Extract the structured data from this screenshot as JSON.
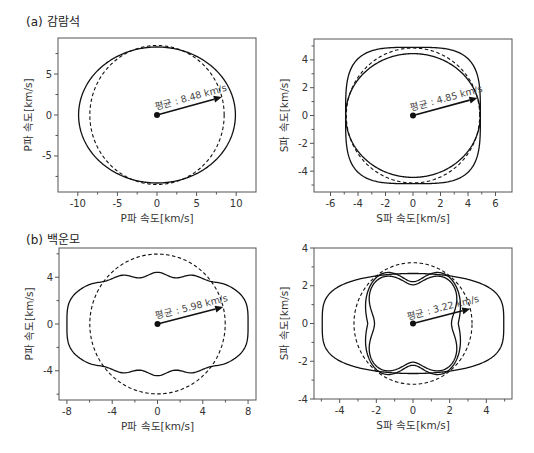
{
  "sections": [
    {
      "label": "(a) 감람석"
    },
    {
      "label": "(b) 백운모"
    }
  ],
  "chart_data": [
    {
      "type": "line",
      "section": "(a) 감람석",
      "xlabel": "P파 속도[km/s]",
      "ylabel": "P파 속도[km/s]",
      "xlim": [
        -12.5,
        12.5
      ],
      "ylim": [
        -9.4,
        9.4
      ],
      "xticks": [
        -10,
        -5,
        0,
        5,
        10
      ],
      "yticks": [
        -5,
        0,
        5
      ],
      "minor_xticks": [
        -7.5,
        -2.5,
        2.5,
        7.5
      ],
      "minor_yticks": [
        -7.5,
        -2.5,
        2.5,
        7.5
      ],
      "annotation": "평균 : 8.48 km/s",
      "mean": 8.48,
      "arrow_angle_deg": 15,
      "series": [
        {
          "name": "velocity surface",
          "style": "solid",
          "shape": "ellipse",
          "a": 9.9,
          "b": 8.3,
          "p": 2
        },
        {
          "name": "mean (isotropic)",
          "style": "dashed",
          "shape": "circle",
          "r": 8.48
        }
      ]
    },
    {
      "type": "line",
      "section": "(a) 감람석",
      "xlabel": "S파 속도[km/s]",
      "ylabel": "S파 속도[km/s]",
      "xlim": [
        -7.2,
        7.2
      ],
      "ylim": [
        -5.5,
        5.5
      ],
      "xticks": [
        -6,
        -4,
        -2,
        0,
        2,
        4,
        6
      ],
      "yticks": [
        -4,
        -2,
        0,
        2,
        4
      ],
      "minor_xticks": [
        -5,
        -3,
        -1,
        1,
        3,
        5
      ],
      "minor_yticks": [
        -5,
        -3,
        -1,
        1,
        3,
        5
      ],
      "annotation": "평균 : 4.85 km/s",
      "mean": 4.85,
      "arrow_angle_deg": 15,
      "series": [
        {
          "name": "S1 surface",
          "style": "solid",
          "shape": "superellipse",
          "a": 4.9,
          "b": 4.9,
          "p": 3.6
        },
        {
          "name": "S2 surface",
          "style": "solid",
          "shape": "ellipse",
          "a": 4.9,
          "b": 4.45,
          "p": 2
        },
        {
          "name": "mean (isotropic)",
          "style": "dashed",
          "shape": "circle",
          "r": 4.85
        }
      ]
    },
    {
      "type": "line",
      "section": "(b) 백운모",
      "xlabel": "P파 속도[km/s]",
      "ylabel": "P파 속도[km/s]",
      "xlim": [
        -8.7,
        8.7
      ],
      "ylim": [
        -6.5,
        6.5
      ],
      "xticks": [
        -8,
        -4,
        0,
        4,
        8
      ],
      "yticks": [
        -4,
        0,
        4
      ],
      "minor_xticks": [
        -6,
        -2,
        2,
        6
      ],
      "minor_yticks": [
        -6,
        -2,
        2,
        6
      ],
      "annotation": "평균 : 5.98 km/s",
      "mean": 5.98,
      "arrow_angle_deg": 14,
      "series": [
        {
          "name": "P surface",
          "style": "solid",
          "shape": "peanut",
          "a": 8.0,
          "b": 4.2,
          "ripple": 0.22
        },
        {
          "name": "mean (isotropic)",
          "style": "dashed",
          "shape": "circle",
          "r": 5.98
        }
      ]
    },
    {
      "type": "line",
      "section": "(b) 백운모",
      "xlabel": "S파 속도[km/s]",
      "ylabel": "S파 속도[km/s]",
      "xlim": [
        -5.4,
        5.4
      ],
      "ylim": [
        -4,
        4
      ],
      "xticks": [
        -4,
        -2,
        0,
        2,
        4
      ],
      "yticks": [
        -4,
        -2,
        0,
        2,
        4
      ],
      "minor_xticks": [
        -5,
        -3,
        -1,
        1,
        3,
        5
      ],
      "minor_yticks": [
        -3,
        -1,
        1,
        3
      ],
      "annotation": "평균 : 3.22 km/s",
      "mean": 3.22,
      "arrow_angle_deg": 14,
      "series": [
        {
          "name": "S1 surface",
          "style": "solid",
          "shape": "peanut",
          "a": 4.95,
          "b": 2.65,
          "ripple": 0.0
        },
        {
          "name": "S2 surface (outer lobes)",
          "style": "solid",
          "shape": "clover",
          "r0": 2.6,
          "amp": 0.5,
          "pinch": 2.05
        },
        {
          "name": "S2 surface (inner)",
          "style": "solid",
          "shape": "squircle",
          "r0": 2.35,
          "pinch": 2.05
        },
        {
          "name": "mean (isotropic)",
          "style": "dashed",
          "shape": "circle",
          "r": 3.22
        }
      ]
    }
  ]
}
